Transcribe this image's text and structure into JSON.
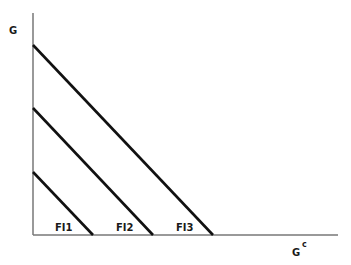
{
  "diagram": {
    "y_axis_label": "G",
    "x_axis_label": "G",
    "x_axis_superscript": "c",
    "curves": [
      {
        "label": "FI1",
        "y_start": 172,
        "x_end": 93,
        "label_x": 52
      },
      {
        "label": "FI2",
        "y_start": 108,
        "x_end": 153,
        "label_x": 112
      },
      {
        "label": "FI3",
        "y_start": 45,
        "x_end": 213,
        "label_x": 172
      }
    ],
    "colors": {
      "line": "#111111",
      "axis": "#555555"
    }
  }
}
